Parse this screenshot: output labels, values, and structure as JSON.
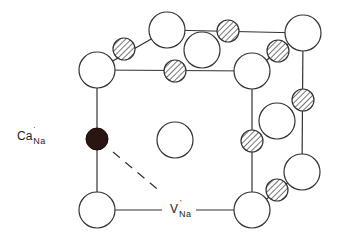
{
  "diagram": {
    "type": "crystal-lattice-unit-cell",
    "labels": {
      "dopant": {
        "main": "Ca",
        "charge": "·",
        "site": "Na"
      },
      "vacancy": {
        "main": "V",
        "charge": "'",
        "site": "Na"
      }
    },
    "colors": {
      "stroke": "#333333",
      "dopant_fill": "#2a1512",
      "hatch": "#555555",
      "background": "#ffffff"
    },
    "large_ions": [
      {
        "id": "front-top-left",
        "cx": 97,
        "cy": 70
      },
      {
        "id": "front-bottom-left",
        "cx": 97,
        "cy": 210
      },
      {
        "id": "front-bottom-right",
        "cx": 252,
        "cy": 210
      },
      {
        "id": "front-top-right",
        "cx": 252,
        "cy": 71
      },
      {
        "id": "back-top-left",
        "cx": 167,
        "cy": 30
      },
      {
        "id": "back-top-right",
        "cx": 303,
        "cy": 33
      },
      {
        "id": "back-bottom-right",
        "cx": 302,
        "cy": 172
      },
      {
        "id": "top-face-center",
        "cx": 202,
        "cy": 50
      },
      {
        "id": "front-face-center",
        "cx": 175,
        "cy": 140
      },
      {
        "id": "right-face-center",
        "cx": 277,
        "cy": 121
      }
    ],
    "small_ions": [
      {
        "id": "edge-front-top",
        "cx": 175,
        "cy": 71
      },
      {
        "id": "edge-top-left",
        "cx": 124,
        "cy": 49
      },
      {
        "id": "edge-back-top",
        "cx": 228,
        "cy": 31
      },
      {
        "id": "edge-top-right",
        "cx": 278,
        "cy": 51
      },
      {
        "id": "edge-back-right",
        "cx": 303,
        "cy": 100
      },
      {
        "id": "edge-front-right",
        "cx": 252,
        "cy": 141
      },
      {
        "id": "edge-bottom-right",
        "cx": 277,
        "cy": 190
      }
    ],
    "dopant_ion": {
      "cx": 97,
      "cy": 139
    },
    "radii": {
      "large": 18,
      "small": 11,
      "dopant": 11
    }
  }
}
